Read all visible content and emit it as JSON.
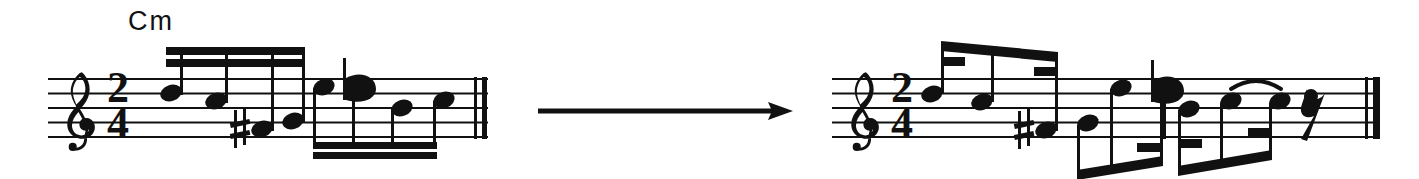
{
  "figure": {
    "kind": "music-notation-transcription",
    "ink_color": "#111111",
    "background_color": "#ffffff"
  },
  "arrow": {
    "name": "transformation-arrow",
    "direction": "right",
    "x1": 538,
    "y1": 111,
    "x2": 793,
    "y2": 111,
    "thickness": 5
  },
  "left_system": {
    "label": "source-notation",
    "chord_symbol": "Cm",
    "chord_symbol_x": 128,
    "chord_symbol_y": 6,
    "staff": {
      "x": 48,
      "width": 440,
      "top": 79,
      "line_gap": 14.5
    },
    "clef": "treble",
    "time_signature": {
      "numerator": "2",
      "denominator": "4"
    },
    "final_barline": "double-thin",
    "beam_groups": [
      {
        "id": "beam-group-1",
        "position": "above",
        "beams": 2,
        "x1": 166,
        "x2": 304,
        "y": 49,
        "note_count": 4
      },
      {
        "id": "beam-group-2",
        "position": "below",
        "beams": 2,
        "x1": 313,
        "x2": 436,
        "y": 144,
        "note_count": 4
      }
    ],
    "notes": [
      {
        "index": 1,
        "x": 171,
        "y": 93,
        "duration": "16th",
        "accidental": "",
        "stem": "up"
      },
      {
        "index": 2,
        "x": 216,
        "y": 100,
        "duration": "16th",
        "accidental": "",
        "stem": "up"
      },
      {
        "index": 3,
        "x": 262,
        "y": 128,
        "duration": "16th",
        "accidental": "sharp",
        "stem": "up"
      },
      {
        "index": 4,
        "x": 303,
        "y": 121,
        "duration": "16th",
        "accidental": "",
        "stem": "up"
      },
      {
        "index": 5,
        "x": 321,
        "y": 86,
        "duration": "16th",
        "accidental": "",
        "stem": "down"
      },
      {
        "index": 6,
        "x": 362,
        "y": 90,
        "duration": "16th",
        "accidental": "flat",
        "stem": "down"
      },
      {
        "index": 7,
        "x": 401,
        "y": 107,
        "duration": "16th",
        "accidental": "",
        "stem": "down"
      },
      {
        "index": 8,
        "x": 440,
        "y": 100,
        "duration": "16th",
        "accidental": "",
        "stem": "down"
      }
    ]
  },
  "right_system": {
    "label": "target-notation",
    "staff": {
      "x": 832,
      "width": 548,
      "top": 79,
      "line_gap": 14.5
    },
    "clef": "treble",
    "time_signature": {
      "numerator": "2",
      "denominator": "4"
    },
    "interior_barline_x": 1163,
    "final_barline": "thin-thick",
    "tie": {
      "x1": 1218,
      "x2": 1268,
      "y": 95,
      "position": "above"
    },
    "rest": {
      "type": "eighth",
      "x": 1288,
      "y": 105
    },
    "beam_groups": [
      {
        "id": "beam-group-1",
        "position": "above",
        "beams": "1+hooks",
        "x1": 941,
        "x2": 1058,
        "y1": 43,
        "y2": 56
      },
      {
        "id": "beam-group-2",
        "position": "below",
        "beams": "1+hooks",
        "x1": 1077,
        "x2": 1163,
        "y1": 172,
        "y2": 156
      },
      {
        "id": "beam-group-3",
        "position": "below",
        "beams": "1+hooks",
        "x1": 1178,
        "x2": 1272,
        "y1": 168,
        "y2": 152
      }
    ],
    "notes": [
      {
        "index": 1,
        "x": 946,
        "y": 93,
        "duration": "dotted-8th",
        "accidental": "",
        "stem": "up"
      },
      {
        "index": 2,
        "x": 994,
        "y": 100,
        "duration": "16th",
        "accidental": "",
        "stem": "up"
      },
      {
        "index": 3,
        "x": 1053,
        "y": 128,
        "duration": "dotted-8th",
        "accidental": "sharp",
        "stem": "up"
      },
      {
        "index": 4,
        "x": 1082,
        "y": 121,
        "duration": "16th",
        "accidental": "",
        "stem": "down"
      },
      {
        "index": 5,
        "x": 1111,
        "y": 86,
        "duration": "dotted-8th",
        "accidental": "",
        "stem": "down"
      },
      {
        "index": 6,
        "x": 1152,
        "y": 90,
        "duration": "16th",
        "accidental": "flat",
        "stem": "down"
      },
      {
        "index": 7,
        "x": 1183,
        "y": 107,
        "duration": "dotted-8th",
        "accidental": "",
        "stem": "down"
      },
      {
        "index": 8,
        "x": 1222,
        "y": 100,
        "duration": "16th",
        "accidental": "",
        "stem": "down"
      },
      {
        "index": 9,
        "x": 1266,
        "y": 100,
        "duration": "16th",
        "accidental": "",
        "stem": "down"
      }
    ]
  }
}
